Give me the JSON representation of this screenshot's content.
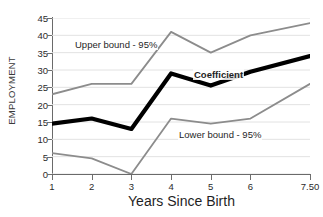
{
  "chart_data": {
    "type": "line",
    "title": "",
    "xlabel": "Years Since Birth",
    "ylabel": "EMPLOYMENT",
    "x": [
      1,
      2,
      3,
      4,
      5,
      6,
      7.5
    ],
    "xtick_labels": [
      "1",
      "2",
      "3",
      "4",
      "5",
      "6",
      "7.50"
    ],
    "ytick_labels": [
      "0",
      "5",
      "10",
      "15",
      "20",
      "25",
      "30",
      "35",
      "40",
      "45"
    ],
    "ytick_values": [
      0,
      5,
      10,
      15,
      20,
      25,
      30,
      35,
      40,
      45
    ],
    "xlim": [
      1,
      7.5
    ],
    "ylim": [
      0,
      45
    ],
    "grid": true,
    "grid_axis": "y",
    "legend_position": "inline-annotations",
    "series": [
      {
        "name": "Upper bound - 95%",
        "values": [
          23,
          26,
          26,
          41,
          35,
          40,
          43.5
        ],
        "color": "#8c8c8c",
        "width": 1.8
      },
      {
        "name": "Coefficient",
        "values": [
          14.5,
          16,
          13,
          29,
          25.5,
          29.5,
          34
        ],
        "color": "#000000",
        "width": 4.2
      },
      {
        "name": "Lower bound - 95%",
        "values": [
          6,
          4.5,
          0,
          16,
          14.5,
          16,
          26
        ],
        "color": "#8c8c8c",
        "width": 1.8
      }
    ],
    "annotations": [
      {
        "text": "Upper bound - 95%",
        "series": "Upper bound - 95%"
      },
      {
        "text": "Coefficient",
        "series": "Coefficient"
      },
      {
        "text": "Lower bound - 95%",
        "series": "Lower bound - 95%"
      }
    ],
    "colors": {
      "axis": "#6a6a6a",
      "grid": "#e2e2e2",
      "text": "#1f1f1f",
      "background": "#ffffff"
    }
  }
}
